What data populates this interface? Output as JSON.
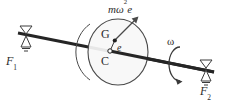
{
  "figure": {
    "background_color": "#ffffff",
    "ink_color": "#2b2b2b",
    "shaft_color": "#252525",
    "disk_fill_color": "#f7f7f7",
    "disk_stroke_color": "#4a4a4a"
  },
  "labels": {
    "force_left": "F",
    "force_left_sub": "1",
    "force_right": "F",
    "force_right_sub": "2",
    "centrifugal_force": "mω",
    "centrifugal_force_sup": "2",
    "centrifugal_force_tail": "e",
    "center_of_gravity": "G",
    "geometric_center": "C",
    "eccentricity": "e",
    "angular_velocity": "ω"
  },
  "elements": {
    "shaft": "shaft-line",
    "disk": "rotor-disk",
    "bearing_left": "bearing-support-left",
    "bearing_right": "bearing-support-right",
    "rotation_arrow": "rotation-direction-arrow",
    "force_vector": "centrifugal-force-vector",
    "eccentricity_line": "eccentricity-offset-line",
    "cg_point": "center-of-gravity-point",
    "center_point": "geometric-center-point"
  },
  "geometry": {
    "shaft_start": [
      18,
      33
    ],
    "shaft_end": [
      214,
      72
    ],
    "disk_center": [
      116,
      52
    ],
    "disk_rx": 30,
    "disk_ry": 33,
    "cg_point": [
      115,
      40
    ],
    "center_point": [
      110,
      51
    ],
    "force_arrow_tip": [
      136,
      17
    ]
  }
}
